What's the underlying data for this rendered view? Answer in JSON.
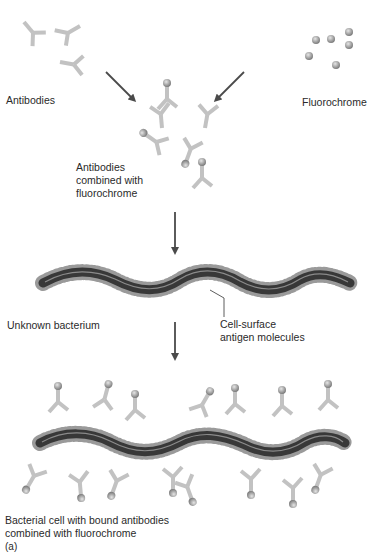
{
  "figure": {
    "panel_label": "(a)",
    "colors": {
      "antibody": "#c4c4c4",
      "antibody_edge": "#a8a8a8",
      "fluorochrome": "#9e9e9e",
      "bacterium_body": "#3a3a3a",
      "bacterium_highlight": "#8a8a8a",
      "antigen_spikes": "#a0a0a0",
      "arrow": "#4a4a4a",
      "text": "#2a2a2a"
    }
  },
  "labels": {
    "antibodies": "Antibodies",
    "fluorochrome": "Fluorochrome",
    "combined_line1": "Antibodies",
    "combined_line2": "combined with",
    "combined_line3": "fluorochrome",
    "unknown_bacterium": "Unknown bacterium",
    "antigen_line1": "Cell-surface",
    "antigen_line2": "antigen molecules",
    "bound_line1": "Bacterial cell with bound antibodies",
    "bound_line2": "combined with fluorochrome",
    "panel": "(a)"
  },
  "steps": [
    {
      "name": "Antibodies",
      "position": "top-left"
    },
    {
      "name": "Fluorochrome",
      "position": "top-right"
    },
    {
      "name": "Antibodies combined with fluorochrome",
      "position": "top-center"
    },
    {
      "name": "Unknown bacterium",
      "position": "middle"
    },
    {
      "name": "Bacterial cell with bound antibodies combined with fluorochrome",
      "position": "bottom"
    }
  ]
}
